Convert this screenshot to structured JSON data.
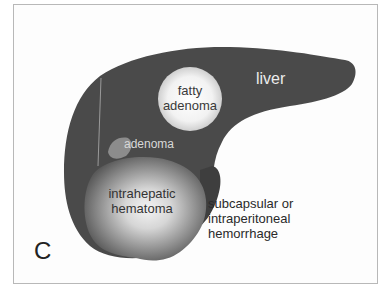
{
  "figure": {
    "panel_letter": "C",
    "organ_label": "liver",
    "lesions": {
      "fatty_adenoma": "fatty\nadenoma",
      "adenoma": "adenoma",
      "intrahepatic_hematoma": "intrahepatic hematoma",
      "hemorrhage": "subcapsular or intraperitoneal hemorrhage"
    },
    "labels": {
      "fatty_line1": "fatty",
      "fatty_line2": "adenoma",
      "hema_line1": "intrahepatic",
      "hema_line2": "hematoma",
      "hemo_line1": "subcapsular or",
      "hemo_line2": "intraperitoneal",
      "hemo_line3": "hemorrhage"
    },
    "colors": {
      "liver": "#4a4a4a",
      "frame": "#b8b8b8",
      "background": "#fdfdfd"
    }
  }
}
